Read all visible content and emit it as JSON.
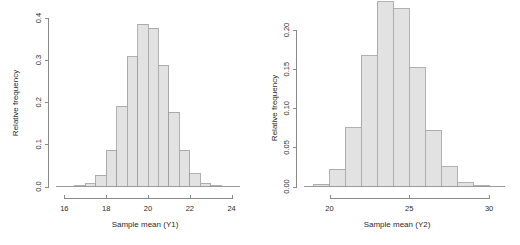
{
  "figure": {
    "background": "#ffffff",
    "bar_fill": "#e2e2e2",
    "bar_stroke": "#9d9d9d",
    "axis_color": "#8a8a8a",
    "text_color": "#2b2b2b",
    "panel_count": 2
  },
  "chart_data": [
    {
      "type": "bar",
      "name": "histogram-y1",
      "title": "",
      "xlabel": "Sample mean (Y1)",
      "ylabel": "Relative frequency",
      "xlim": [
        15.6,
        24.4
      ],
      "ylim": [
        0,
        0.4
      ],
      "grid": false,
      "legend": null,
      "bin_width": 0.5,
      "xticks": [
        16,
        18,
        20,
        22,
        24
      ],
      "xtick_labels": [
        "16",
        "18",
        "20",
        "22",
        "24"
      ],
      "yticks": [
        0.0,
        0.1,
        0.2,
        0.3,
        0.4
      ],
      "ytick_labels": [
        "0.0",
        "0.1",
        "0.2",
        "0.3",
        "0.4"
      ],
      "bin_edges": [
        16.5,
        17.0,
        17.5,
        18.0,
        18.5,
        19.0,
        19.5,
        20.0,
        20.5,
        21.0,
        21.5,
        22.0,
        22.5,
        23.0,
        23.5
      ],
      "bin_centers": [
        16.75,
        17.25,
        17.75,
        18.25,
        18.75,
        19.25,
        19.75,
        20.25,
        20.75,
        21.25,
        21.75,
        22.25,
        22.75,
        23.25
      ],
      "values": [
        0.002,
        0.007,
        0.027,
        0.086,
        0.191,
        0.308,
        0.385,
        0.376,
        0.288,
        0.176,
        0.086,
        0.03,
        0.008,
        0.002
      ]
    },
    {
      "type": "bar",
      "name": "histogram-y2",
      "title": "",
      "xlabel": "Sample mean (Y2)",
      "ylabel": "Relative frequency",
      "xlim": [
        18.4,
        31.0
      ],
      "ylim": [
        0,
        0.2
      ],
      "grid": false,
      "legend": null,
      "bin_width": 1.0,
      "xticks": [
        20,
        25,
        30
      ],
      "xtick_labels": [
        "20",
        "25",
        "30"
      ],
      "yticks": [
        0.0,
        0.05,
        0.1,
        0.15,
        0.2
      ],
      "ytick_labels": [
        "0.00",
        "0.05",
        "0.10",
        "0.15",
        "0.20"
      ],
      "bin_edges": [
        19.0,
        20.0,
        21.0,
        22.0,
        23.0,
        24.0,
        25.0,
        26.0,
        27.0,
        28.0,
        29.0,
        30.0
      ],
      "bin_centers": [
        19.5,
        20.5,
        21.5,
        22.5,
        23.5,
        24.5,
        25.5,
        26.5,
        27.5,
        28.5,
        29.5
      ],
      "values": [
        0.003,
        0.022,
        0.075,
        0.167,
        0.236,
        0.227,
        0.152,
        0.072,
        0.025,
        0.005,
        0.001
      ]
    }
  ]
}
